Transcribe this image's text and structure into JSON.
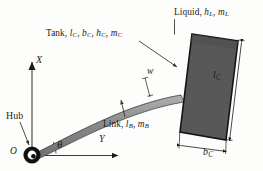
{
  "figure": {
    "background_color": "#fdfdfc",
    "ink_color": "#1c1c1c"
  },
  "labels": {
    "tank": {
      "prefix": "Tank, ",
      "params": [
        {
          "sym": "l",
          "sub": "C"
        },
        {
          "sym": "b",
          "sub": "C"
        },
        {
          "sym": "h",
          "sub": "C"
        },
        {
          "sym": "m",
          "sub": "C"
        }
      ]
    },
    "liquid": {
      "prefix": "Liquid, ",
      "params": [
        {
          "sym": "h",
          "sub": "L"
        },
        {
          "sym": "m",
          "sub": "L"
        }
      ]
    },
    "link": {
      "prefix": "Link, ",
      "params": [
        {
          "sym": "l",
          "sub": "B"
        },
        {
          "sym": "m",
          "sub": "B"
        }
      ]
    },
    "hub": "Hub",
    "origin": "O",
    "axis_x": "X",
    "axis_y": "Y",
    "theta": "θ",
    "deflection": "w",
    "tank_length": {
      "sym": "l",
      "sub": "C"
    },
    "tank_width": {
      "sym": "b",
      "sub": "C"
    }
  },
  "geometry": {
    "hub": {
      "cx": 32,
      "cy": 155,
      "outer_r": 8.5,
      "inner_r": 3.2
    },
    "axis_x_arrow": {
      "x1": 32,
      "y1": 152,
      "x2": 32,
      "y2": 60
    },
    "axis_y_arrow": {
      "x1": 36,
      "y1": 155,
      "x2": 122,
      "y2": 155
    },
    "theta_arc_radius": 22,
    "theta_degrees": 26,
    "link_color": "#8c8c8c",
    "tank_fill": "#585858",
    "tank_edge": "#1a1a1a",
    "tank_corners": "192,34 238,41 226,140 180,132"
  },
  "colors": {
    "tank_fill": "#585858",
    "link_gray": "#8c8c8c",
    "stroke_black": "#1a1a1a",
    "leader_gray": "#4a4a4a"
  }
}
